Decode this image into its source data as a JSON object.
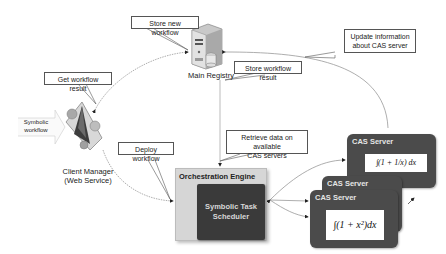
{
  "diagram": {
    "nodes": {
      "main_registry": {
        "label": "Main Registry",
        "icon": "server-icon"
      },
      "client_manager": {
        "label_line1": "Client Manager",
        "label_line2": "(Web Service)",
        "icon": "client-manager-icon"
      },
      "symbolic_workflow_input": {
        "label_line1": "Symbolic",
        "label_line2": "workflow"
      },
      "orchestration_engine": {
        "title": "Orchestration Engine",
        "scheduler": {
          "line1": "Symbolic Task",
          "line2": "Scheduler"
        }
      },
      "cas_servers": [
        {
          "title": "CAS Server",
          "formula": "∫(1 + 1/x) dx"
        },
        {
          "title": "CAS Server",
          "formula": ""
        },
        {
          "title": "CAS Server",
          "formula": "∫(1 + x²)dx"
        }
      ]
    },
    "callouts": {
      "store_new_workflow": "Store new workflow",
      "get_workflow_result": "Get workflow result",
      "store_workflow_result": "Store workflow result",
      "update_info_line1": "Update information",
      "update_info_line2": "about CAS server",
      "deploy_workflow": "Deploy workflow",
      "retrieve_line1": "Retrieve data on available",
      "retrieve_line2": "CAS servers"
    },
    "colors": {
      "callout_border": "#555555",
      "orchestration_bg": "#d6d6d6",
      "scheduler_bg": "#3a3a3a",
      "cas_bg": "#4b4b4b",
      "link": "#888888"
    }
  }
}
